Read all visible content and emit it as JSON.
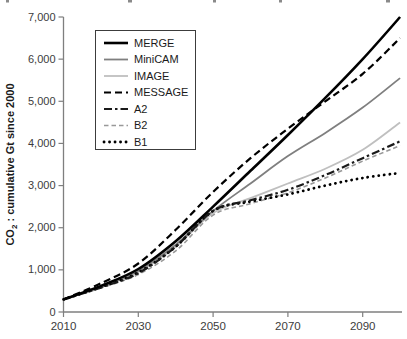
{
  "colors": {
    "background": "#ffffff",
    "axis": "#7f7f7f",
    "tick_text": "#3c3c3c",
    "legend_border": "#3c3c3c",
    "legend_text": "#1a1a1a"
  },
  "chart_data": {
    "type": "line",
    "title": "",
    "xlabel": "",
    "ylabel_prefix": "CO",
    "ylabel_subscript": "2",
    "ylabel_suffix": " : cumulative Gt since 2000",
    "x": [
      2010,
      2020,
      2030,
      2040,
      2050,
      2060,
      2070,
      2080,
      2090,
      2100
    ],
    "x_tick_values": [
      2010,
      2030,
      2050,
      2070,
      2090
    ],
    "x_tick_labels": [
      "2010",
      "2030",
      "2050",
      "2070",
      "2090"
    ],
    "y_tick_values": [
      0,
      1000,
      2000,
      3000,
      4000,
      5000,
      6000,
      7000
    ],
    "y_tick_labels": [
      "0",
      "1,000",
      "2,000",
      "3,000",
      "4,000",
      "5,000",
      "6,000",
      "7,000"
    ],
    "xlim": [
      2010,
      2102
    ],
    "ylim": [
      0,
      7000
    ],
    "grid": false,
    "legend_position": "upper-left-inside",
    "series": [
      {
        "name": "MERGE",
        "color": "#000000",
        "style": "solid",
        "width": 2.6,
        "values": [
          300,
          620,
          1020,
          1680,
          2500,
          3350,
          4200,
          5080,
          6000,
          7000
        ]
      },
      {
        "name": "MiniCAM",
        "color": "#7f7f7f",
        "style": "solid",
        "width": 1.8,
        "values": [
          300,
          600,
          980,
          1600,
          2400,
          3050,
          3700,
          4250,
          4850,
          5550
        ]
      },
      {
        "name": "IMAGE",
        "color": "#bfbfbf",
        "style": "solid",
        "width": 1.8,
        "values": [
          300,
          590,
          950,
          1550,
          2350,
          2700,
          3050,
          3400,
          3850,
          4500
        ]
      },
      {
        "name": "MESSAGE",
        "color": "#000000",
        "style": "dashed",
        "width": 2.2,
        "values": [
          300,
          680,
          1150,
          1950,
          2850,
          3650,
          4350,
          5000,
          5650,
          6500
        ]
      },
      {
        "name": "A2",
        "color": "#1a1a1a",
        "style": "dash-dot",
        "width": 2.2,
        "values": [
          300,
          580,
          920,
          1550,
          2400,
          2650,
          2900,
          3250,
          3650,
          4050
        ]
      },
      {
        "name": "B2",
        "color": "#999999",
        "style": "dashed-short",
        "width": 1.6,
        "values": [
          300,
          570,
          890,
          1450,
          2300,
          2570,
          2830,
          3180,
          3580,
          3950
        ]
      },
      {
        "name": "B1",
        "color": "#000000",
        "style": "dotted",
        "width": 2.8,
        "values": [
          300,
          590,
          940,
          1550,
          2400,
          2620,
          2790,
          3000,
          3180,
          3300
        ]
      }
    ],
    "z_order": [
      "IMAGE",
      "B2",
      "MiniCAM",
      "B1",
      "A2",
      "MESSAGE",
      "MERGE"
    ]
  }
}
